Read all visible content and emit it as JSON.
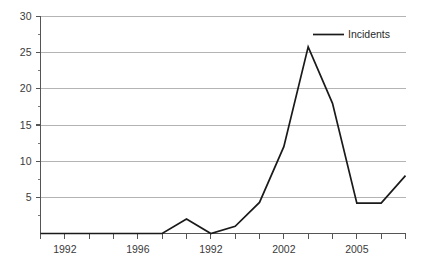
{
  "chart_data": {
    "type": "line",
    "title": "",
    "xlabel": "",
    "ylabel": "",
    "ylim": [
      0,
      30
    ],
    "y_ticks": [
      0,
      5,
      10,
      15,
      20,
      25,
      30
    ],
    "y_tick_labels": [
      "",
      "5",
      "10",
      "15",
      "20",
      "25",
      "30"
    ],
    "y_minor_ticks": [
      2.5,
      7.5,
      12.5,
      17.5,
      22.5,
      27.5
    ],
    "grid": "horizontal",
    "legend_position": "top-right",
    "x_tick_count": 16,
    "x_tick_labels": [
      {
        "index": 1,
        "label": "1992"
      },
      {
        "index": 4,
        "label": "1996"
      },
      {
        "index": 7,
        "label": "1992"
      },
      {
        "index": 10,
        "label": "2002"
      },
      {
        "index": 13,
        "label": "2005"
      }
    ],
    "series": [
      {
        "name": "Incidents",
        "color": "#1a1a1a",
        "x": [
          0,
          1,
          2,
          3,
          4,
          5,
          6,
          7,
          8,
          9,
          10,
          11,
          12,
          13,
          14,
          15
        ],
        "values": [
          0,
          0,
          0,
          0,
          0,
          0,
          2,
          0,
          1,
          4.3,
          12,
          25.8,
          18,
          4.2,
          4.2,
          8
        ]
      }
    ]
  },
  "legend": {
    "entries": [
      {
        "label": "Incidents"
      }
    ]
  }
}
